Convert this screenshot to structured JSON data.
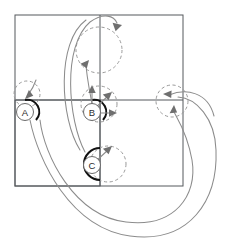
{
  "figure": {
    "title": "",
    "background_color": "#ffffff",
    "width": 238,
    "height": 251
  },
  "colors": {
    "frame_line": "#55585c",
    "thick_arc": "#111111",
    "dashed_circle": "#9a9a9a",
    "flow_curve": "#8c8c8c",
    "arrowhead": "#6f6f6f",
    "node_fill": "#ffffff",
    "node_stroke": "#6b6b6b",
    "label_text": "#2b2b2b"
  },
  "frames": {
    "outer_rect": {
      "x": 15,
      "y": 15,
      "width": 168,
      "height": 171
    },
    "inner_rect": {
      "x": 15,
      "y": 100,
      "width": 85,
      "height": 86
    },
    "divider_horizontal": {
      "x1": 15,
      "y1": 100,
      "x2": 183,
      "y2": 100
    },
    "divider_vertical": {
      "x1": 100,
      "y1": 15,
      "x2": 100,
      "y2": 186
    }
  },
  "nodes": [
    {
      "id": "A",
      "label": "A",
      "cx": 25,
      "cy": 112,
      "r": 8.5,
      "arc_description": "thick quarter arc opening up-left at corner A"
    },
    {
      "id": "B",
      "label": "B",
      "cx": 92,
      "cy": 112,
      "r": 8.5,
      "arc_description": "thick quarter arc opening up-left at corner B"
    },
    {
      "id": "C",
      "label": "C",
      "cx": 92,
      "cy": 165,
      "r": 8.5,
      "arc_description": "thick half arc opening right at corner C"
    }
  ],
  "dashed_circles": [
    {
      "name": "ghost-circle-top",
      "cx": 99,
      "cy": 50,
      "r": 23
    },
    {
      "name": "ghost-circle-a",
      "cx": 27,
      "cy": 94,
      "r": 13
    },
    {
      "name": "ghost-circle-b",
      "cx": 99,
      "cy": 104,
      "r": 18
    },
    {
      "name": "ghost-circle-c",
      "cx": 108,
      "cy": 164,
      "r": 18
    },
    {
      "name": "ghost-circle-right",
      "cx": 172,
      "cy": 101,
      "r": 16
    }
  ],
  "arrows": [
    {
      "name": "arrow-b-up",
      "direction": "up",
      "from": [
        92,
        112
      ],
      "to": [
        92,
        88
      ]
    },
    {
      "name": "arrow-b-diagonal",
      "direction": "up-right",
      "from": [
        92,
        112
      ],
      "to": [
        110,
        94
      ]
    },
    {
      "name": "arrow-b-right",
      "direction": "right",
      "from": [
        92,
        112
      ],
      "to": [
        116,
        112
      ]
    },
    {
      "name": "arrow-c-diagonal",
      "direction": "up-right",
      "from": [
        92,
        165
      ],
      "to": [
        110,
        148
      ]
    },
    {
      "name": "arrow-a-down",
      "direction": "down-left",
      "from": [
        34,
        84
      ],
      "to": [
        26,
        97
      ]
    },
    {
      "name": "arrow-top-right-in",
      "direction": "right-down",
      "to": [
        118,
        24
      ]
    },
    {
      "name": "arrow-top-left-in",
      "direction": "up-right",
      "to": [
        87,
        62
      ]
    },
    {
      "name": "arrow-right-in-left",
      "direction": "left",
      "to": [
        167,
        95
      ]
    },
    {
      "name": "arrow-right-in-up",
      "direction": "up",
      "to": [
        173,
        110
      ]
    }
  ],
  "flow_curves": [
    {
      "name": "curve-b-to-top-circle",
      "description": "from B upward curving to top dashed circle left side"
    },
    {
      "name": "curve-c-to-top-right",
      "description": "from C sweeping up and over to the top dashed circle right side"
    },
    {
      "name": "curve-a-long-bottom",
      "description": "long sweep from A down around bottom to the right"
    },
    {
      "name": "curve-inner-long-bottom",
      "description": "second long bottom sweep ending at right dashed circle"
    },
    {
      "name": "curve-right-outer",
      "description": "outer right loop returning into the right dashed circle"
    }
  ]
}
